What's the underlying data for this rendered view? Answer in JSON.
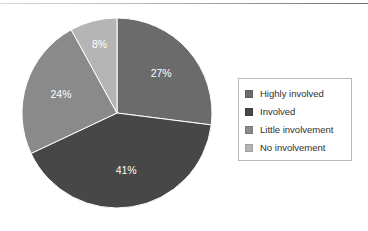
{
  "chart_data": {
    "type": "pie",
    "title": "",
    "subtitle": "",
    "xlabel": "",
    "ylabel": "",
    "grid": false,
    "legend_position": "right",
    "start_angle_oclock": 12,
    "direction": "clockwise",
    "categories": [
      "Highly involved",
      "Involved",
      "Little involvement",
      "No involvement"
    ],
    "values": [
      27,
      41,
      24,
      8
    ],
    "value_unit": "%",
    "data_labels": [
      "27%",
      "41%",
      "24%",
      "8%"
    ],
    "slice_colors": [
      "#6b6b6b",
      "#474747",
      "#8a8a8a",
      "#b5b5b5"
    ],
    "slices": [
      {
        "label": "Highly involved",
        "value": 27,
        "data_label": "27%",
        "color": "#6b6b6b"
      },
      {
        "label": "Involved",
        "value": 41,
        "data_label": "41%",
        "color": "#474747"
      },
      {
        "label": "Little involvement",
        "value": 24,
        "data_label": "24%",
        "color": "#8a8a8a"
      },
      {
        "label": "No involvement",
        "value": 8,
        "data_label": "8%",
        "color": "#b5b5b5"
      }
    ]
  },
  "legend": {
    "items": [
      {
        "label": "Highly involved",
        "swatch_color": "#6b6b6b",
        "swatch_icon": "legend-square-icon"
      },
      {
        "label": "Involved",
        "swatch_color": "#474747",
        "swatch_icon": "legend-square-icon"
      },
      {
        "label": "Little involvement",
        "swatch_color": "#8a8a8a",
        "swatch_icon": "legend-square-icon"
      },
      {
        "label": "No involvement",
        "swatch_color": "#b5b5b5",
        "swatch_icon": "legend-square-icon"
      }
    ]
  },
  "figure": {
    "background_color": "#ffffff",
    "rule_color": "#8e8e8e",
    "legend_border_color": "#b9b9b9",
    "label_text_color": "#ffffff",
    "legend_text_color": "#2f2f2f"
  }
}
